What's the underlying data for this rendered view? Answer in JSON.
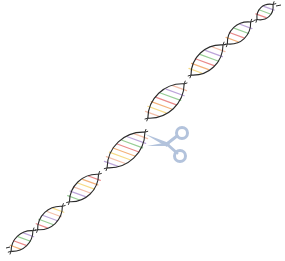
{
  "figure": {
    "colors": {
      "background": "#ffffff",
      "strand": "#2b2b2b",
      "scissors": "#b3c3dc",
      "base_pairs": [
        "#f6d77a",
        "#f3a96b",
        "#e87d7d",
        "#8cc98a",
        "#b59bd6",
        "#f2b8a0"
      ]
    },
    "helix_segments": [
      {
        "cx": 22,
        "cy": 241,
        "len": 30,
        "width": 13
      },
      {
        "cx": 50,
        "cy": 218,
        "len": 34,
        "width": 15
      },
      {
        "cx": 84,
        "cy": 188,
        "len": 40,
        "width": 17
      },
      {
        "cx": 126,
        "cy": 150,
        "len": 52,
        "width": 22
      },
      {
        "cx": 166,
        "cy": 101,
        "len": 50,
        "width": 21
      },
      {
        "cx": 207,
        "cy": 60,
        "len": 44,
        "width": 19
      },
      {
        "cx": 239,
        "cy": 33,
        "len": 32,
        "width": 15
      },
      {
        "cx": 265,
        "cy": 12,
        "len": 22,
        "width": 12
      }
    ],
    "scissors": {
      "x": 143,
      "y": 124,
      "width": 50,
      "height": 42,
      "icon": "scissors-icon"
    }
  }
}
